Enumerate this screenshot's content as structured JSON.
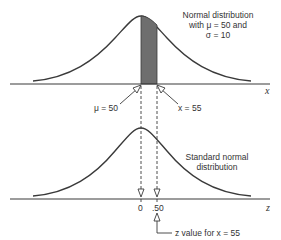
{
  "top_panel": {
    "annotation_lines": [
      "Normal distribution",
      "with μ = 50 and",
      "σ = 10"
    ],
    "axis_label": "x",
    "mean_label": "μ = 50",
    "x_value_label": "x = 55",
    "mean": 50,
    "sd": 10,
    "x_value": 55,
    "shaded_region": {
      "from": 50,
      "to": 55,
      "color": "#6e6e6e"
    }
  },
  "bottom_panel": {
    "annotation_lines": [
      "Standard normal",
      "distribution"
    ],
    "axis_label": "z",
    "tick_labels": [
      "0",
      ".50"
    ],
    "z_value_note": "z value for x = 55",
    "mean": 0,
    "sd": 1,
    "z_value": 0.5
  },
  "colors": {
    "curve": "#3a3a3a",
    "axis": "#3a3a3a",
    "shade": "#6e6e6e",
    "text": "#333333"
  }
}
